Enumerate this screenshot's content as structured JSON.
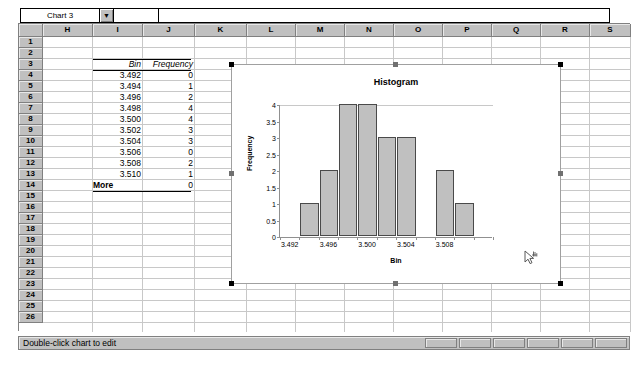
{
  "window": {
    "name_box_value": "Chart 3",
    "name_box_dropdown_icon": "chevron-down-icon",
    "formula_value": ""
  },
  "grid": {
    "column_headers": [
      "H",
      "I",
      "J",
      "K",
      "L",
      "M",
      "N",
      "O",
      "P",
      "Q",
      "R",
      "S"
    ],
    "row_headers": [
      "1",
      "2",
      "3",
      "4",
      "5",
      "6",
      "7",
      "8",
      "9",
      "10",
      "11",
      "12",
      "13",
      "14",
      "15",
      "16",
      "17",
      "18",
      "19",
      "20",
      "21",
      "22",
      "23",
      "24",
      "25",
      "26"
    ]
  },
  "table": {
    "header_bin": "Bin",
    "header_frequency": "Frequency",
    "rows": [
      {
        "row": "4",
        "bin": "3.492",
        "frequency": "0"
      },
      {
        "row": "5",
        "bin": "3.494",
        "frequency": "1"
      },
      {
        "row": "6",
        "bin": "3.496",
        "frequency": "2"
      },
      {
        "row": "7",
        "bin": "3.498",
        "frequency": "4"
      },
      {
        "row": "8",
        "bin": "3.500",
        "frequency": "4"
      },
      {
        "row": "9",
        "bin": "3.502",
        "frequency": "3"
      },
      {
        "row": "10",
        "bin": "3.504",
        "frequency": "3"
      },
      {
        "row": "11",
        "bin": "3.506",
        "frequency": "0"
      },
      {
        "row": "12",
        "bin": "3.508",
        "frequency": "2"
      },
      {
        "row": "13",
        "bin": "3.510",
        "frequency": "1"
      },
      {
        "row": "14",
        "bin": "More",
        "frequency": "0"
      }
    ]
  },
  "chart_data": {
    "type": "bar",
    "title": "Histogram",
    "xlabel": "Bin",
    "ylabel": "Frequency",
    "categories": [
      "3.492",
      "3.494",
      "3.496",
      "3.498",
      "3.500",
      "3.502",
      "3.504",
      "3.506",
      "3.508",
      "3.510",
      "More"
    ],
    "values": [
      0,
      1,
      2,
      4,
      4,
      3,
      3,
      0,
      2,
      1,
      0
    ],
    "xtick_labels": [
      "3.492",
      "3.496",
      "3.500",
      "3.504",
      "3.508"
    ],
    "ytick_labels": [
      "0",
      "0.5",
      "1",
      "1.5",
      "2",
      "2.5",
      "3",
      "3.5",
      "4"
    ],
    "ylim": [
      0,
      4
    ],
    "grid": false,
    "legend": "none",
    "bar_fill_color": "#c0c0c0",
    "bar_border_color": "#4a4a4a"
  },
  "status": {
    "message": "Double-click chart to edit",
    "indicator_count": 6
  },
  "cursor": {
    "icon": "arrow-chart-cursor-icon"
  }
}
